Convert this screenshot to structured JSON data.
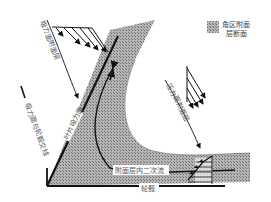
{
  "diagram": {
    "type": "corner-region boundary layer schematic",
    "legend": {
      "swatch": "hatched-gray",
      "line1": "角区附面",
      "line2": "层断面"
    },
    "labels": {
      "suction_side_bl": "吸力面附面层",
      "pressure_side_bl": "压力面附面层",
      "suction_side_hub_corner": "吸力面与轮毂交线",
      "blade_suction_surface": "叶片吸力面",
      "secondary_flow": "附面层内二次流",
      "hub": "轮毂"
    },
    "colors": {
      "fill_pattern": "#9a9a9a",
      "line": "#111111",
      "background": "#ffffff"
    }
  }
}
